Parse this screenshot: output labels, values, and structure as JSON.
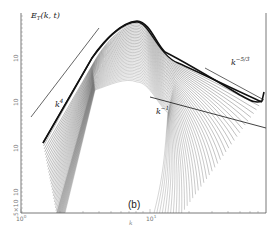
{
  "chart_data": {
    "type": "line",
    "title": "",
    "panel_label": "(b)",
    "ylabel": "E_T(k,t)",
    "xlabel": "k",
    "xscale": "log",
    "yscale": "log",
    "x_ticks": [
      "10^0",
      "10^1"
    ],
    "y_ticks": [
      "10^?",
      "10^?",
      "10^?",
      "10^?",
      "5×10^?"
    ],
    "grid": false,
    "legend": "none",
    "series_count": 40,
    "peak": {
      "k": 6,
      "y_px": 22
    },
    "annotations": [
      {
        "text": "E_T(k,t)",
        "x_px": 31,
        "y_px": 16
      },
      {
        "text": "k^4",
        "x_px": 56,
        "y_px": 105,
        "reference_slope": 4
      },
      {
        "text": "k^-1",
        "x_px": 157,
        "y_px": 112,
        "reference_slope": -1
      },
      {
        "text": "k^-5/3",
        "x_px": 231,
        "y_px": 62,
        "reference_slope": -1.6667
      }
    ]
  },
  "labels": {
    "ylabel_main": "E",
    "ylabel_sub": "T",
    "ylabel_args": "(k, t)",
    "k4_base": "k",
    "k4_exp": "4",
    "km1_base": "k",
    "km1_exp": "−1",
    "k53_base": "k",
    "k53_exp": "−5/3",
    "panel": "(b)",
    "xlabel": "k",
    "xtick0": "10",
    "xtick0_exp": "0",
    "xtick1": "10",
    "xtick1_exp": "1",
    "ytick_a": "10",
    "ytick_b": "10",
    "ytick_c": "10",
    "ytick_d": "10",
    "ytick_e": "5×10"
  },
  "style": {
    "line_color": "#111111",
    "axis_color": "#444444",
    "ref_line_color": "#222222"
  }
}
